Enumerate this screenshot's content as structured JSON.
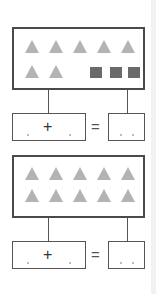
{
  "worksheet": {
    "exercises": [
      {
        "id": 1,
        "picture": {
          "rows": [
            [
              "triangle",
              "triangle",
              "triangle",
              "triangle",
              "triangle"
            ],
            [
              "triangle",
              "triangle",
              "",
              "square",
              "square",
              "square"
            ]
          ],
          "triangle_count": 7,
          "square_count": 3,
          "triangle_color": "#b3b3b3",
          "square_color": "#6a6a6a"
        },
        "equation": {
          "operator": "+",
          "equals": "=",
          "addend_1": "",
          "addend_2": "",
          "sum": ""
        }
      },
      {
        "id": 2,
        "picture": {
          "rows": [
            [
              "triangle",
              "triangle",
              "triangle",
              "triangle",
              "triangle"
            ],
            [
              "triangle",
              "triangle",
              "triangle",
              "triangle",
              "triangle"
            ]
          ],
          "triangle_count": 10,
          "square_count": 0,
          "triangle_color": "#b3b3b3"
        },
        "equation": {
          "operator": "+",
          "equals": "=",
          "addend_1": "",
          "addend_2": "",
          "sum": ""
        }
      }
    ]
  }
}
